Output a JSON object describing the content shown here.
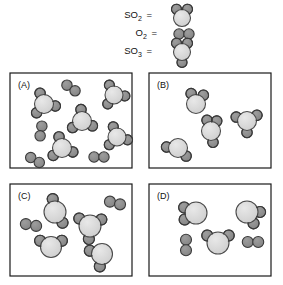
{
  "figure": {
    "background_color": "#ffffff"
  },
  "colors": {
    "sulfur_fill": "#d4d4d4",
    "sulfur_stroke": "#4a4a4a",
    "oxygen_fill": "#8c8c8c",
    "oxygen_stroke": "#3a3a3a",
    "panel_border": "#1a1a1a",
    "text": "#111111"
  },
  "legend": {
    "entries": [
      {
        "id": "legend-so2",
        "formula": "SO",
        "subscript": "2",
        "equals": "=",
        "name": "sulfur-dioxide",
        "atoms": {
          "sulfur": 1,
          "oxygen": 2
        },
        "label_x": 152,
        "label_y": 18,
        "center_x": 182,
        "center_y": 17
      },
      {
        "id": "legend-o2",
        "formula": "O",
        "subscript": "2",
        "equals": "=",
        "name": "dioxygen",
        "atoms": {
          "sulfur": 0,
          "oxygen": 2
        },
        "label_x": 157,
        "label_y": 36,
        "center_x": 182,
        "center_y": 34
      },
      {
        "id": "legend-so3",
        "formula": "SO",
        "subscript": "3",
        "equals": "=",
        "name": "sulfur-trioxide",
        "atoms": {
          "sulfur": 1,
          "oxygen": 3
        },
        "label_x": 152,
        "label_y": 54,
        "center_x": 182,
        "center_y": 52
      }
    ]
  },
  "panels": [
    {
      "id": "panel-a",
      "label": "(A)",
      "label_x": 18,
      "label_y": 88,
      "box": {
        "x": 10,
        "y": 73,
        "w": 122,
        "h": 95
      },
      "molecule_counts": {
        "SO3": 5,
        "O2": 4,
        "SO2": 0
      },
      "molecules": [
        {
          "type": "SO3",
          "cx": 44,
          "cy": 104,
          "r": 9.5,
          "or": 5.2,
          "angles": [
            250,
            10,
            130
          ]
        },
        {
          "type": "SO3",
          "cx": 82,
          "cy": 121,
          "r": 9.5,
          "or": 5.2,
          "angles": [
            265,
            25,
            145
          ]
        },
        {
          "type": "SO3",
          "cx": 114,
          "cy": 95,
          "r": 9.0,
          "or": 5.0,
          "angles": [
            245,
            5,
            125
          ]
        },
        {
          "type": "SO3",
          "cx": 117,
          "cy": 137,
          "r": 9.0,
          "or": 5.0,
          "angles": [
            250,
            15,
            135
          ]
        },
        {
          "type": "SO3",
          "cx": 62,
          "cy": 148,
          "r": 9.5,
          "or": 5.2,
          "angles": [
            255,
            20,
            140
          ]
        },
        {
          "type": "O2",
          "cx": 71,
          "cy": 88,
          "or": 5.2,
          "angle": 35
        },
        {
          "type": "O2",
          "cx": 41,
          "cy": 131,
          "or": 5.2,
          "angle": 100
        },
        {
          "type": "O2",
          "cx": 35,
          "cy": 160,
          "or": 5.2,
          "angle": 30
        },
        {
          "type": "O2",
          "cx": 99,
          "cy": 157,
          "or": 5.2,
          "angle": 0
        }
      ]
    },
    {
      "id": "panel-b",
      "label": "(B)",
      "label_x": 157,
      "label_y": 88,
      "box": {
        "x": 149,
        "y": 73,
        "w": 122,
        "h": 95
      },
      "molecule_counts": {
        "SO3": 2,
        "SO2": 2,
        "O2": 0
      },
      "molecules": [
        {
          "type": "SO2",
          "cx": 196,
          "cy": 104,
          "r": 9.5,
          "or": 5.2,
          "angles": [
            245,
            310
          ]
        },
        {
          "type": "SO3",
          "cx": 211,
          "cy": 131,
          "r": 9.5,
          "or": 5.2,
          "angles": [
            250,
            300,
            80
          ]
        },
        {
          "type": "SO3",
          "cx": 247,
          "cy": 121,
          "r": 9.5,
          "or": 5.2,
          "angles": [
            200,
            330,
            90
          ]
        },
        {
          "type": "SO2",
          "cx": 178,
          "cy": 148,
          "r": 9.5,
          "or": 5.2,
          "angles": [
            185,
            45
          ]
        }
      ]
    },
    {
      "id": "panel-c",
      "label": "(C)",
      "label_x": 18,
      "label_y": 199,
      "box": {
        "x": 10,
        "y": 184,
        "w": 122,
        "h": 92
      },
      "molecule_counts": {
        "SO2": 4,
        "O2": 2,
        "SO3": 0
      },
      "molecules": [
        {
          "type": "SO2",
          "cx": 55,
          "cy": 212,
          "r": 11.0,
          "or": 5.5,
          "angles": [
            260,
            55
          ]
        },
        {
          "type": "SO2",
          "cx": 90,
          "cy": 226,
          "r": 11.0,
          "or": 5.5,
          "angles": [
            215,
            330,
            95
          ]
        },
        {
          "type": "SO2",
          "cx": 51,
          "cy": 247,
          "r": 10.5,
          "or": 5.5,
          "angles": [
            210,
            330
          ]
        },
        {
          "type": "SO2",
          "cx": 102,
          "cy": 254,
          "r": 10.5,
          "or": 5.5,
          "angles": [
            195,
            100
          ]
        },
        {
          "type": "O2",
          "cx": 31,
          "cy": 225,
          "or": 5.5,
          "angle": 10
        },
        {
          "type": "O2",
          "cx": 115,
          "cy": 203,
          "or": 5.5,
          "angle": 15
        }
      ]
    },
    {
      "id": "panel-d",
      "label": "(D)",
      "label_x": 157,
      "label_y": 199,
      "box": {
        "x": 149,
        "y": 184,
        "w": 122,
        "h": 92
      },
      "molecule_counts": {
        "SO2": 3,
        "O2": 2,
        "SO3": 0
      },
      "molecules": [
        {
          "type": "SO2",
          "cx": 196,
          "cy": 213,
          "r": 11.0,
          "or": 5.5,
          "angles": [
            205,
            150
          ]
        },
        {
          "type": "SO2",
          "cx": 247,
          "cy": 212,
          "r": 11.0,
          "or": 5.5,
          "angles": [
            0,
            60
          ]
        },
        {
          "type": "SO2",
          "cx": 218,
          "cy": 243,
          "r": 11.0,
          "or": 5.5,
          "angles": [
            215,
            325
          ]
        },
        {
          "type": "O2",
          "cx": 186,
          "cy": 245,
          "or": 5.5,
          "angle": 90
        },
        {
          "type": "O2",
          "cx": 253,
          "cy": 242,
          "or": 5.5,
          "angle": 0
        }
      ]
    }
  ]
}
